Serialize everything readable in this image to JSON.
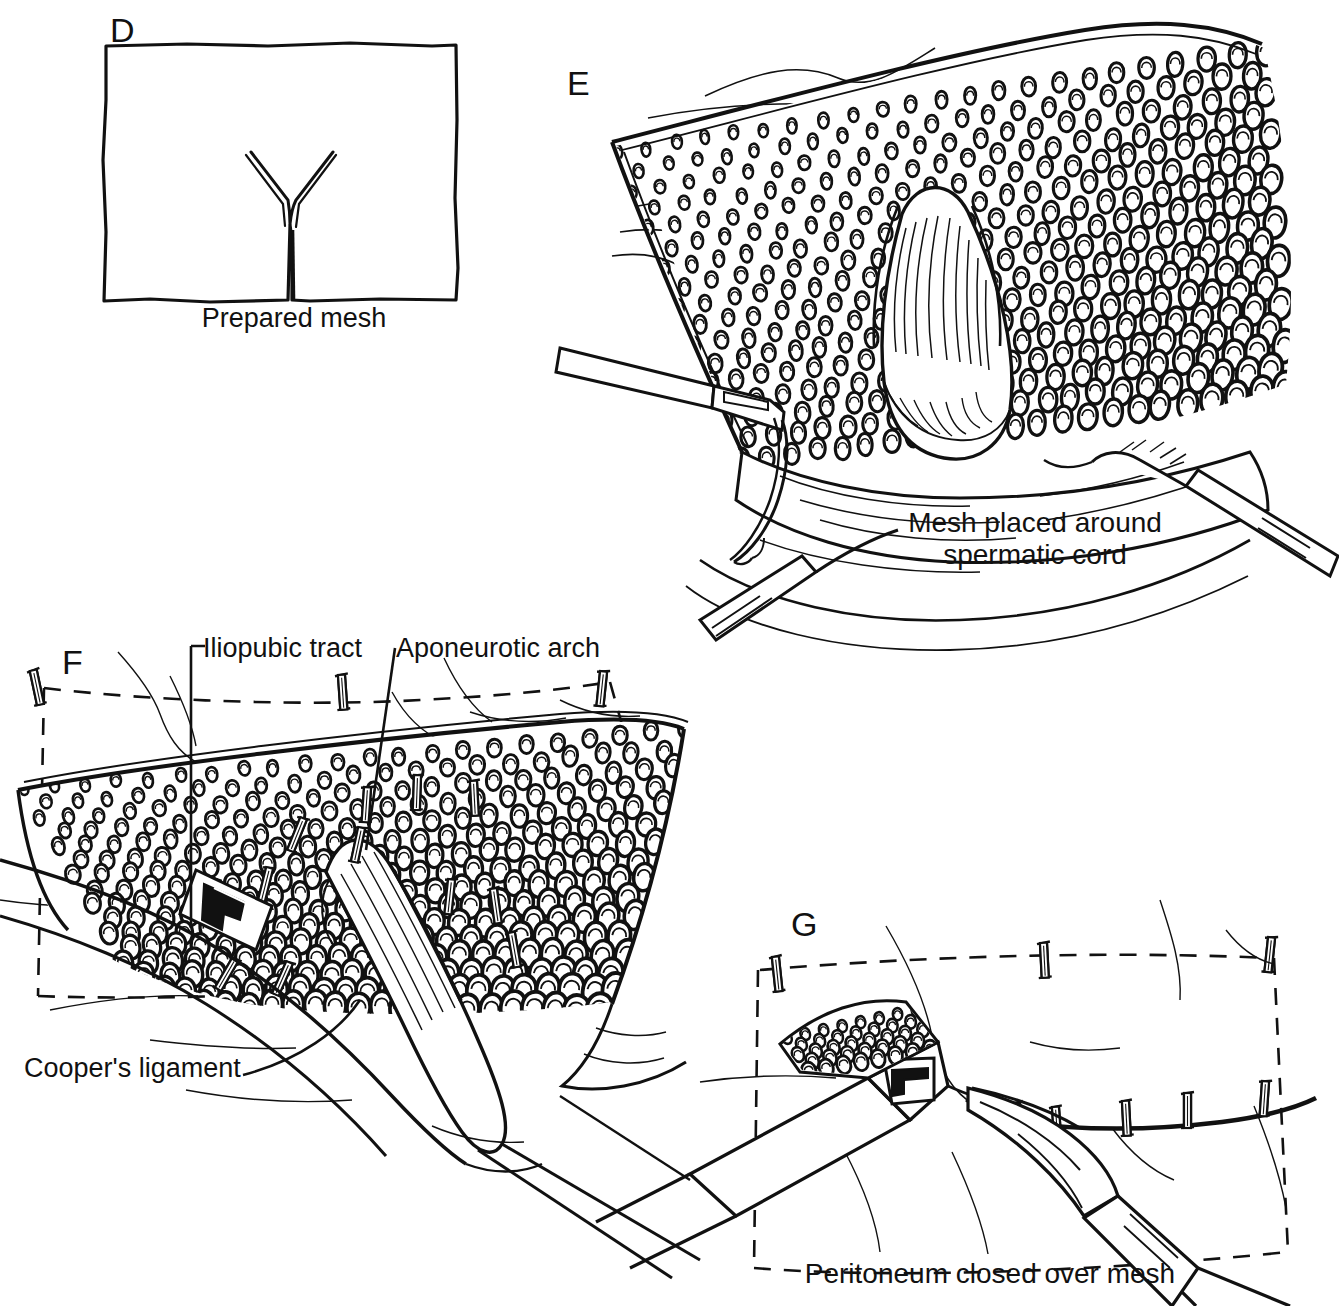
{
  "figure": {
    "kind": "surgical-line-art-illustration",
    "background_color": "#ffffff",
    "ink_color": "#111111",
    "panel_count": 4
  },
  "panels": {
    "d": {
      "letter": "D",
      "caption": "Prepared mesh",
      "content": "Rectangular sheet of prosthetic mesh drawn as a hand-sketched outline with a Y-shaped slit cut from the bottom edge up to the centre to accommodate the spermatic cord."
    },
    "e": {
      "letter": "E",
      "caption": "Mesh placed around\nspermatic cord",
      "content": "Knitted mesh laid over the dissected preperitoneal space; the spermatic cord emerges through the Y slit. Laparoscopic graspers hold the mesh edges at left and right."
    },
    "f": {
      "letter": "F",
      "caption": "",
      "labels": [
        {
          "text": "Iliopubic tract",
          "id": "iliopubic-tract"
        },
        {
          "text": "Aponeurotic arch",
          "id": "aponeurotic-arch"
        },
        {
          "text": "Cooper's ligament",
          "id": "coopers-ligament"
        }
      ],
      "content": "Mesh stapled into place. Staples are driven along the aponeurotic arch superiorly, the iliopubic tract, and Cooper's ligament. The peritoneal flap is indicated by a dashed outline."
    },
    "g": {
      "letter": "G",
      "caption": "Peritoneum closed over mesh",
      "content": "Peritoneal flap reapproximated over the mesh with a row of staples; an endoscopic stapler at left and a grasper at right. Dashed line marks the peritoneal flap border."
    }
  },
  "colors": {
    "ink": "#111111",
    "paper": "#ffffff"
  }
}
